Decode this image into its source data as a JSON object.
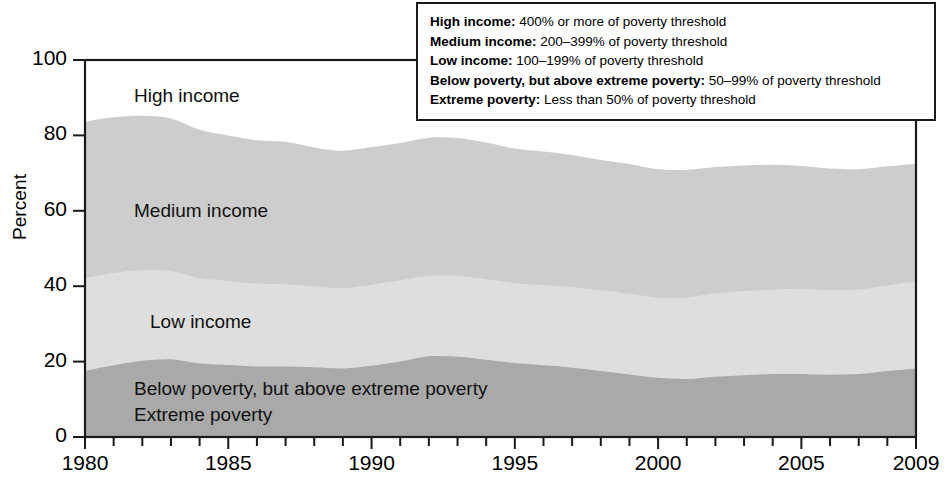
{
  "chart_data": {
    "type": "area",
    "title": "",
    "xlabel": "",
    "ylabel": "Percent",
    "xlim": [
      1980,
      2009
    ],
    "ylim": [
      0,
      100
    ],
    "grid": false,
    "stacked": true,
    "legend_position": "top-right-box",
    "x": [
      1980,
      1981,
      1982,
      1983,
      1984,
      1985,
      1986,
      1987,
      1988,
      1989,
      1990,
      1991,
      1992,
      1993,
      1994,
      1995,
      1996,
      1997,
      1998,
      1999,
      2000,
      2001,
      2002,
      2003,
      2004,
      2005,
      2006,
      2007,
      2008,
      2009
    ],
    "xticks": [
      1980,
      1985,
      1990,
      1995,
      2000,
      2005,
      2009
    ],
    "xtick_labels": [
      "1980",
      "1985",
      "1990",
      "1995",
      "2000",
      "2005",
      "2009"
    ],
    "yticks": [
      0,
      20,
      40,
      60,
      80,
      100
    ],
    "ytick_labels": [
      "0",
      "20",
      "40",
      "60",
      "80",
      "100"
    ],
    "series": [
      {
        "name": "Extreme poverty",
        "label": "Extreme poverty",
        "color": "#a9a9a9",
        "values": [
          5.0,
          5.4,
          6.0,
          6.2,
          5.9,
          5.7,
          5.6,
          5.7,
          5.6,
          5.4,
          5.6,
          6.0,
          6.3,
          6.4,
          6.1,
          5.9,
          5.6,
          5.5,
          5.3,
          5.0,
          4.8,
          4.9,
          5.2,
          5.4,
          5.5,
          5.5,
          5.4,
          5.5,
          5.9,
          6.3
        ]
      },
      {
        "name": "Below poverty, but above extreme poverty",
        "label": "Below poverty, but above extreme poverty",
        "color": "#a9a9a9",
        "values": [
          12.5,
          13.6,
          14.2,
          14.4,
          13.6,
          13.4,
          13.1,
          13.0,
          12.9,
          12.8,
          13.3,
          14.0,
          15.1,
          14.9,
          14.4,
          13.7,
          13.4,
          12.9,
          12.2,
          11.6,
          10.9,
          10.5,
          10.8,
          11.0,
          11.2,
          11.2,
          11.1,
          11.2,
          11.6,
          11.9
        ]
      },
      {
        "name": "Low income",
        "label": "Low income",
        "color": "#dedede",
        "values": [
          24.6,
          24.5,
          24.1,
          23.4,
          22.6,
          22.3,
          22.0,
          21.8,
          21.5,
          21.3,
          21.5,
          21.6,
          21.3,
          21.4,
          21.4,
          21.2,
          21.3,
          21.4,
          21.5,
          21.4,
          21.3,
          21.6,
          22.1,
          22.3,
          22.4,
          22.6,
          22.5,
          22.4,
          22.7,
          23.1
        ]
      },
      {
        "name": "Medium income",
        "label": "Medium income",
        "color": "#cdcdcd",
        "values": [
          41.5,
          41.3,
          40.9,
          40.5,
          39.4,
          38.6,
          38.0,
          37.8,
          36.8,
          36.4,
          36.5,
          36.4,
          36.7,
          36.6,
          36.2,
          35.7,
          35.4,
          35.0,
          34.5,
          34.4,
          34.0,
          33.9,
          33.5,
          33.3,
          33.1,
          32.6,
          32.2,
          31.9,
          31.6,
          31.2
        ]
      },
      {
        "name": "High income",
        "label": "High income",
        "color": "#ffffff",
        "values": [
          16.4,
          15.2,
          14.8,
          15.5,
          18.5,
          20.0,
          21.3,
          21.7,
          23.2,
          24.1,
          23.1,
          22.0,
          20.6,
          20.7,
          21.9,
          23.5,
          24.3,
          25.2,
          26.5,
          27.6,
          29.0,
          29.1,
          28.4,
          28.0,
          27.8,
          28.1,
          28.8,
          29.0,
          28.2,
          27.5
        ]
      }
    ],
    "boundaries": {
      "poverty_top": [
        17.5,
        19.0,
        20.2,
        20.6,
        19.5,
        19.1,
        18.7,
        18.7,
        18.5,
        18.2,
        18.9,
        20.0,
        21.4,
        21.3,
        20.5,
        19.6,
        19.0,
        18.4,
        17.5,
        16.6,
        15.7,
        15.4,
        16.0,
        16.4,
        16.7,
        16.7,
        16.5,
        16.7,
        17.5,
        18.2
      ],
      "low_top": [
        42.1,
        43.5,
        44.3,
        44.0,
        42.1,
        41.4,
        40.7,
        40.5,
        40.0,
        39.5,
        40.4,
        41.6,
        42.7,
        42.7,
        41.9,
        40.8,
        40.3,
        39.8,
        39.0,
        38.0,
        37.0,
        37.0,
        38.1,
        38.7,
        39.1,
        39.3,
        39.0,
        39.1,
        40.2,
        41.3
      ],
      "medium_top": [
        83.6,
        84.8,
        85.2,
        84.5,
        81.5,
        80.0,
        78.7,
        78.3,
        76.8,
        75.9,
        76.9,
        78.0,
        79.4,
        79.3,
        78.1,
        76.5,
        75.7,
        74.8,
        73.5,
        72.4,
        71.0,
        70.9,
        71.6,
        72.0,
        72.2,
        71.9,
        71.2,
        71.0,
        71.8,
        72.5
      ]
    }
  },
  "axis": {
    "y_title": "Percent"
  },
  "legend": {
    "rows": [
      {
        "term": "High income:",
        "definition": " 400% or more of poverty threshold"
      },
      {
        "term": "Medium income:",
        "definition": " 200–399% of poverty threshold"
      },
      {
        "term": "Low income:",
        "definition": " 100–199% of poverty threshold"
      },
      {
        "term": "Below poverty, but above extreme poverty:",
        "definition": " 50–99% of poverty threshold"
      },
      {
        "term": "Extreme poverty:",
        "definition": " Less than 50% of poverty threshold"
      }
    ]
  },
  "band_labels": {
    "high": "High income",
    "medium": "Medium income",
    "low": "Low income",
    "below_poverty": "Below poverty, but above extreme poverty",
    "extreme": "Extreme poverty"
  },
  "colors": {
    "high_income": "#ffffff",
    "medium_income": "#cdcdcd",
    "low_income": "#dedede",
    "poverty": "#a9a9a9",
    "axis": "#1a1a1a",
    "text": "#000000"
  }
}
